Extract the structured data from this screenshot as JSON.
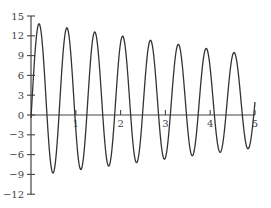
{
  "chart_data": {
    "type": "line",
    "title": "",
    "xlabel": "",
    "ylabel": "",
    "xlim": [
      0,
      5
    ],
    "ylim": [
      -12,
      15
    ],
    "grid": false,
    "legend": null,
    "x_ticks": [
      1,
      2,
      3,
      4,
      5
    ],
    "x_tick_labels": [
      "1",
      "2",
      "3",
      "4",
      "5"
    ],
    "y_ticks": [
      15,
      12,
      9,
      6,
      3,
      0,
      -3,
      -6,
      -9,
      -12
    ],
    "y_tick_labels": [
      "15",
      "12",
      "9",
      "6",
      "3",
      "0",
      "−3",
      "−6",
      "−9",
      "−12"
    ],
    "series": [
      {
        "name": "damped oscillation",
        "color": "#333333",
        "model": "y = m(t) + A(t)*cos(2*pi*(t - 0.18)/0.622)",
        "midline_start": 2.4,
        "midline_end": 2.0,
        "amp_start": 11.6,
        "amp_end": 7.0,
        "peaks": [
          {
            "x": 0.18,
            "y": 14.0
          },
          {
            "x": 0.83,
            "y": 13.1
          },
          {
            "x": 1.45,
            "y": 12.5
          },
          {
            "x": 2.05,
            "y": 11.6
          },
          {
            "x": 2.68,
            "y": 11.0
          },
          {
            "x": 3.28,
            "y": 10.3
          },
          {
            "x": 3.93,
            "y": 9.6
          },
          {
            "x": 4.55,
            "y": 9.0
          }
        ],
        "troughs": [
          {
            "x": 0.49,
            "y": -9.2
          },
          {
            "x": 1.12,
            "y": -8.8
          },
          {
            "x": 1.74,
            "y": -8.0
          },
          {
            "x": 2.37,
            "y": -7.3
          },
          {
            "x": 2.99,
            "y": -6.8
          },
          {
            "x": 3.62,
            "y": -6.2
          },
          {
            "x": 4.24,
            "y": -5.6
          },
          {
            "x": 4.87,
            "y": -5.0
          }
        ]
      }
    ]
  },
  "layout": {
    "x0_px": 31,
    "x5_px": 255,
    "y0_px": 115,
    "y_per_unit_px": 6.6
  }
}
